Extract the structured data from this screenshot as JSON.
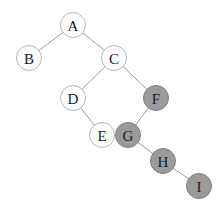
{
  "diagram": {
    "type": "node-link-graph",
    "canvas": {
      "width": 223,
      "height": 211,
      "background": "#ffffff"
    },
    "styles": {
      "node_radius": 12.5,
      "node_fill_unshaded": "#fdfdfd",
      "node_fill_shaded": "#9b9b9b",
      "node_stroke_unshaded": "#b8b8b8",
      "node_stroke_shaded": "#7d7d7d",
      "edge_stroke": "#9a9a9a",
      "edge_width": 1,
      "label_color": "#1a1a1a",
      "label_font_size": 15
    },
    "nodes": [
      {
        "id": "A",
        "label": "A",
        "x": 73,
        "y": 25,
        "shaded": false
      },
      {
        "id": "B",
        "label": "B",
        "x": 29,
        "y": 58,
        "shaded": false
      },
      {
        "id": "C",
        "label": "C",
        "x": 114,
        "y": 58,
        "shaded": false
      },
      {
        "id": "D",
        "label": "D",
        "x": 73,
        "y": 98,
        "shaded": false
      },
      {
        "id": "E",
        "label": "E",
        "x": 102,
        "y": 135,
        "shaded": false
      },
      {
        "id": "F",
        "label": "F",
        "x": 156,
        "y": 98,
        "shaded": true
      },
      {
        "id": "G",
        "label": "G",
        "x": 128,
        "y": 135,
        "shaded": true
      },
      {
        "id": "H",
        "label": "H",
        "x": 163,
        "y": 161,
        "shaded": true
      },
      {
        "id": "I",
        "label": "I",
        "x": 199,
        "y": 186,
        "shaded": true
      }
    ],
    "edges": [
      {
        "from": "A",
        "to": "B"
      },
      {
        "from": "A",
        "to": "C"
      },
      {
        "from": "C",
        "to": "D"
      },
      {
        "from": "C",
        "to": "F"
      },
      {
        "from": "D",
        "to": "E"
      },
      {
        "from": "F",
        "to": "G"
      },
      {
        "from": "G",
        "to": "H"
      },
      {
        "from": "H",
        "to": "I"
      }
    ]
  }
}
